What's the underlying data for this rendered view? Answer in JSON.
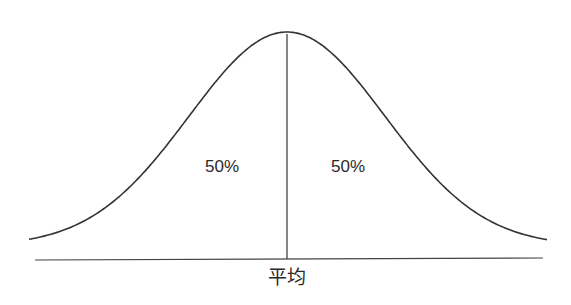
{
  "diagram": {
    "type": "normal-distribution",
    "left_area_label": "50%",
    "right_area_label": "50%",
    "mean_label": "平均",
    "colors": {
      "line": "#333333",
      "text": "#2a2a2a",
      "background": "#ffffff"
    }
  },
  "chart_data": {
    "type": "line",
    "title": "",
    "xlabel": "平均",
    "ylabel": "",
    "series": [
      {
        "name": "normal curve",
        "shape": "gaussian",
        "mean_position": "center"
      }
    ],
    "annotations": [
      {
        "text": "50%",
        "region": "left of mean"
      },
      {
        "text": "50%",
        "region": "right of mean"
      },
      {
        "text": "平均",
        "position": "x-axis at mean"
      }
    ],
    "grid": false,
    "legend": "none"
  }
}
